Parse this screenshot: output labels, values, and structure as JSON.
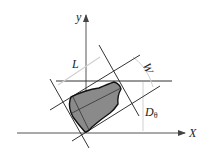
{
  "diagram": {
    "type": "geometry-schematic",
    "labels": {
      "y_axis": "y",
      "x_axis": "X",
      "length": "L",
      "width": "W",
      "distance_main": "D",
      "distance_sub": "θ"
    },
    "colors": {
      "line": "#333333",
      "fill": "#8a8a8a",
      "dimension": "#cccccc"
    }
  }
}
